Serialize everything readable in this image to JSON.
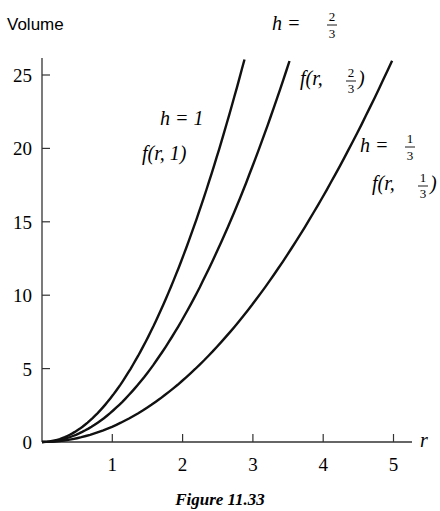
{
  "chart_data": {
    "type": "line",
    "title": "",
    "caption": "Figure 11.33",
    "xlabel": "r",
    "ylabel": "Volume",
    "xlim": [
      0,
      5.2
    ],
    "ylim": [
      0,
      26
    ],
    "xticks": [
      "1",
      "2",
      "3",
      "4",
      "5"
    ],
    "yticks": [
      "0",
      "5",
      "10",
      "15",
      "20",
      "25"
    ],
    "grid": false,
    "legend": "inline labels",
    "series": [
      {
        "name": "f(r, 1)",
        "label_h": "h = 1",
        "h": 1,
        "x": [
          0,
          0.5,
          1,
          1.5,
          2,
          2.5,
          2.88
        ],
        "y": [
          0,
          0.79,
          3.14,
          7.07,
          12.57,
          19.63,
          26.06
        ]
      },
      {
        "name": "f(r, 2/3)",
        "label_h": "h = 2/3",
        "h": 0.6667,
        "x": [
          0,
          0.5,
          1,
          1.5,
          2,
          2.5,
          3,
          3.52
        ],
        "y": [
          0,
          0.52,
          2.09,
          4.71,
          8.38,
          13.09,
          18.85,
          25.95
        ]
      },
      {
        "name": "f(r, 1/3)",
        "label_h": "h = 1/3",
        "h": 0.3333,
        "x": [
          0,
          1,
          2,
          3,
          4,
          4.98
        ],
        "y": [
          0,
          1.05,
          4.19,
          9.42,
          16.76,
          25.97
        ]
      }
    ]
  },
  "labels": {
    "ylabel": "Volume",
    "xlabel": "r",
    "origin": "0",
    "caption": "Figure 11.33",
    "h1": "h = 1",
    "f1": "f(r, 1)",
    "h2": "h = ",
    "f2a": "f(r, ",
    "f2b": ")",
    "h3": "h = ",
    "f3a": "f(r, ",
    "f3b": ")",
    "frac2_num": "2",
    "frac_den": "3",
    "frac3_num": "1"
  }
}
